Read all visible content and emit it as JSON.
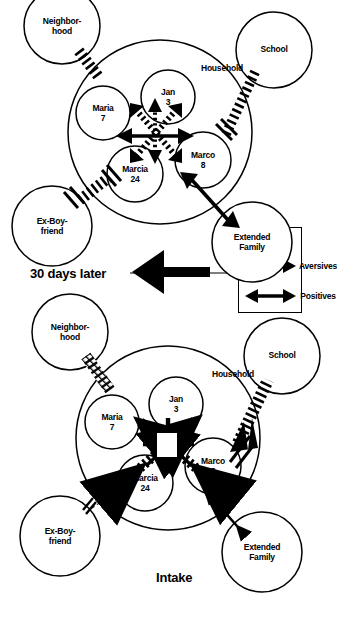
{
  "figure": {
    "type": "ecomap-comparison",
    "orientation": "page rotated 90 degrees (landscape figure on portrait page)"
  },
  "panels": [
    {
      "id": "intake",
      "title": "Intake",
      "household_label": "Household",
      "inner_nodes": [
        {
          "name": "Marcia",
          "age": "24"
        },
        {
          "name": "Maria",
          "age": "7"
        },
        {
          "name": "Jan",
          "age": "3"
        },
        {
          "name": "Marco",
          "age": "8"
        }
      ],
      "outer_nodes": [
        {
          "label": "Ex-Boy-\nfriend"
        },
        {
          "label": "Neighbor-\nhood"
        },
        {
          "label": "Extended\nFamily"
        },
        {
          "label": "School"
        }
      ]
    },
    {
      "id": "thirty-days-later",
      "title": "30 days later",
      "household_label": "Household",
      "inner_nodes": [
        {
          "name": "Marcia",
          "age": "24"
        },
        {
          "name": "Maria",
          "age": "7"
        },
        {
          "name": "Jan",
          "age": "3"
        },
        {
          "name": "Marco",
          "age": "8"
        }
      ],
      "outer_nodes": [
        {
          "label": "Ex-Boy-\nfriend"
        },
        {
          "label": "Neighbor-\nhood"
        },
        {
          "label": "Extended\nFamily"
        },
        {
          "label": "School"
        }
      ]
    }
  ],
  "legend": {
    "positives_label": "Positives",
    "aversives_label": "Aversives"
  },
  "colors": {
    "ink": "#000000",
    "paper": "#ffffff"
  }
}
